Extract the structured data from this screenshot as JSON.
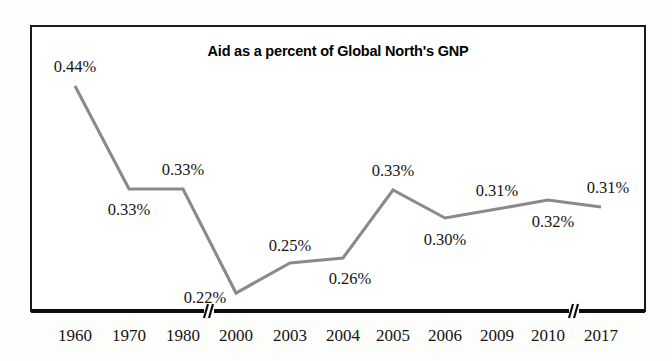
{
  "chart_data": {
    "type": "line",
    "title": "Aid as a percent of Global North's GNP",
    "xlabel": "",
    "ylabel": "",
    "categories": [
      "1960",
      "1970",
      "1980",
      "2000",
      "2003",
      "2004",
      "2005",
      "2006",
      "2009",
      "2010",
      "2017"
    ],
    "values": [
      0.44,
      0.33,
      0.33,
      0.22,
      0.25,
      0.26,
      0.33,
      0.3,
      0.31,
      0.32,
      0.31
    ],
    "point_labels": [
      "0.44%",
      "0.33%",
      "0.33%",
      "0.22%",
      "0.25%",
      "0.26%",
      "0.33%",
      "0.30%",
      "0.31%",
      "0.32%",
      "0.31%"
    ],
    "ylim": [
      0.2,
      0.46
    ],
    "grid": false,
    "legend": null,
    "axis_breaks": [
      "between 1980 and 2000",
      "between 2010 and 2017"
    ],
    "series_color": "#8a8a8a",
    "axis_color": "#0d0d0d",
    "text_color": "#141414",
    "background_color": "#ffffff",
    "label_positions": [
      "above",
      "below",
      "above",
      "below",
      "above",
      "below",
      "above",
      "below",
      "above",
      "below",
      "above"
    ]
  },
  "points": [
    {
      "year": "1960",
      "label": "0.44%",
      "x": 75,
      "y": 86,
      "lx": 75,
      "ly": 72,
      "anchor": "above"
    },
    {
      "year": "1970",
      "label": "0.33%",
      "x": 129,
      "y": 189,
      "lx": 129,
      "ly": 215,
      "anchor": "below"
    },
    {
      "year": "1980",
      "label": "0.33%",
      "x": 183,
      "y": 189,
      "lx": 183,
      "ly": 175,
      "anchor": "above"
    },
    {
      "year": "2000",
      "label": "0.22%",
      "x": 236,
      "y": 293,
      "lx": 205,
      "ly": 303,
      "anchor": "below"
    },
    {
      "year": "2003",
      "label": "0.25%",
      "x": 290,
      "y": 263,
      "lx": 290,
      "ly": 251,
      "anchor": "above"
    },
    {
      "year": "2004",
      "label": "0.26%",
      "x": 343,
      "y": 258,
      "lx": 350,
      "ly": 284,
      "anchor": "below"
    },
    {
      "year": "2005",
      "label": "0.33%",
      "x": 393,
      "y": 190,
      "lx": 393,
      "ly": 176,
      "anchor": "above"
    },
    {
      "year": "2006",
      "label": "0.30%",
      "x": 445,
      "y": 218,
      "lx": 445,
      "ly": 245,
      "anchor": "below"
    },
    {
      "year": "2009",
      "label": "0.31%",
      "x": 497,
      "y": 209,
      "lx": 497,
      "ly": 196,
      "anchor": "above"
    },
    {
      "year": "2010",
      "label": "0.32%",
      "x": 548,
      "y": 200,
      "lx": 553,
      "ly": 227,
      "anchor": "below"
    },
    {
      "year": "2017",
      "label": "0.31%",
      "x": 601,
      "y": 207,
      "lx": 608,
      "ly": 193,
      "anchor": "above"
    }
  ],
  "ticks": [
    {
      "label": "1960",
      "x": 75
    },
    {
      "label": "1970",
      "x": 129
    },
    {
      "label": "1980",
      "x": 183
    },
    {
      "label": "2000",
      "x": 236
    },
    {
      "label": "2003",
      "x": 290
    },
    {
      "label": "2004",
      "x": 343
    },
    {
      "label": "2005",
      "x": 393
    },
    {
      "label": "2006",
      "x": 445
    },
    {
      "label": "2009",
      "x": 497
    },
    {
      "label": "2010",
      "x": 548
    },
    {
      "label": "2017",
      "x": 601
    }
  ],
  "breaks": [
    {
      "x": 209
    },
    {
      "x": 574
    }
  ],
  "frame": {
    "x": 31,
    "y": 26,
    "width": 614,
    "height": 285
  },
  "title_pos": {
    "x": 338,
    "y": 56
  }
}
